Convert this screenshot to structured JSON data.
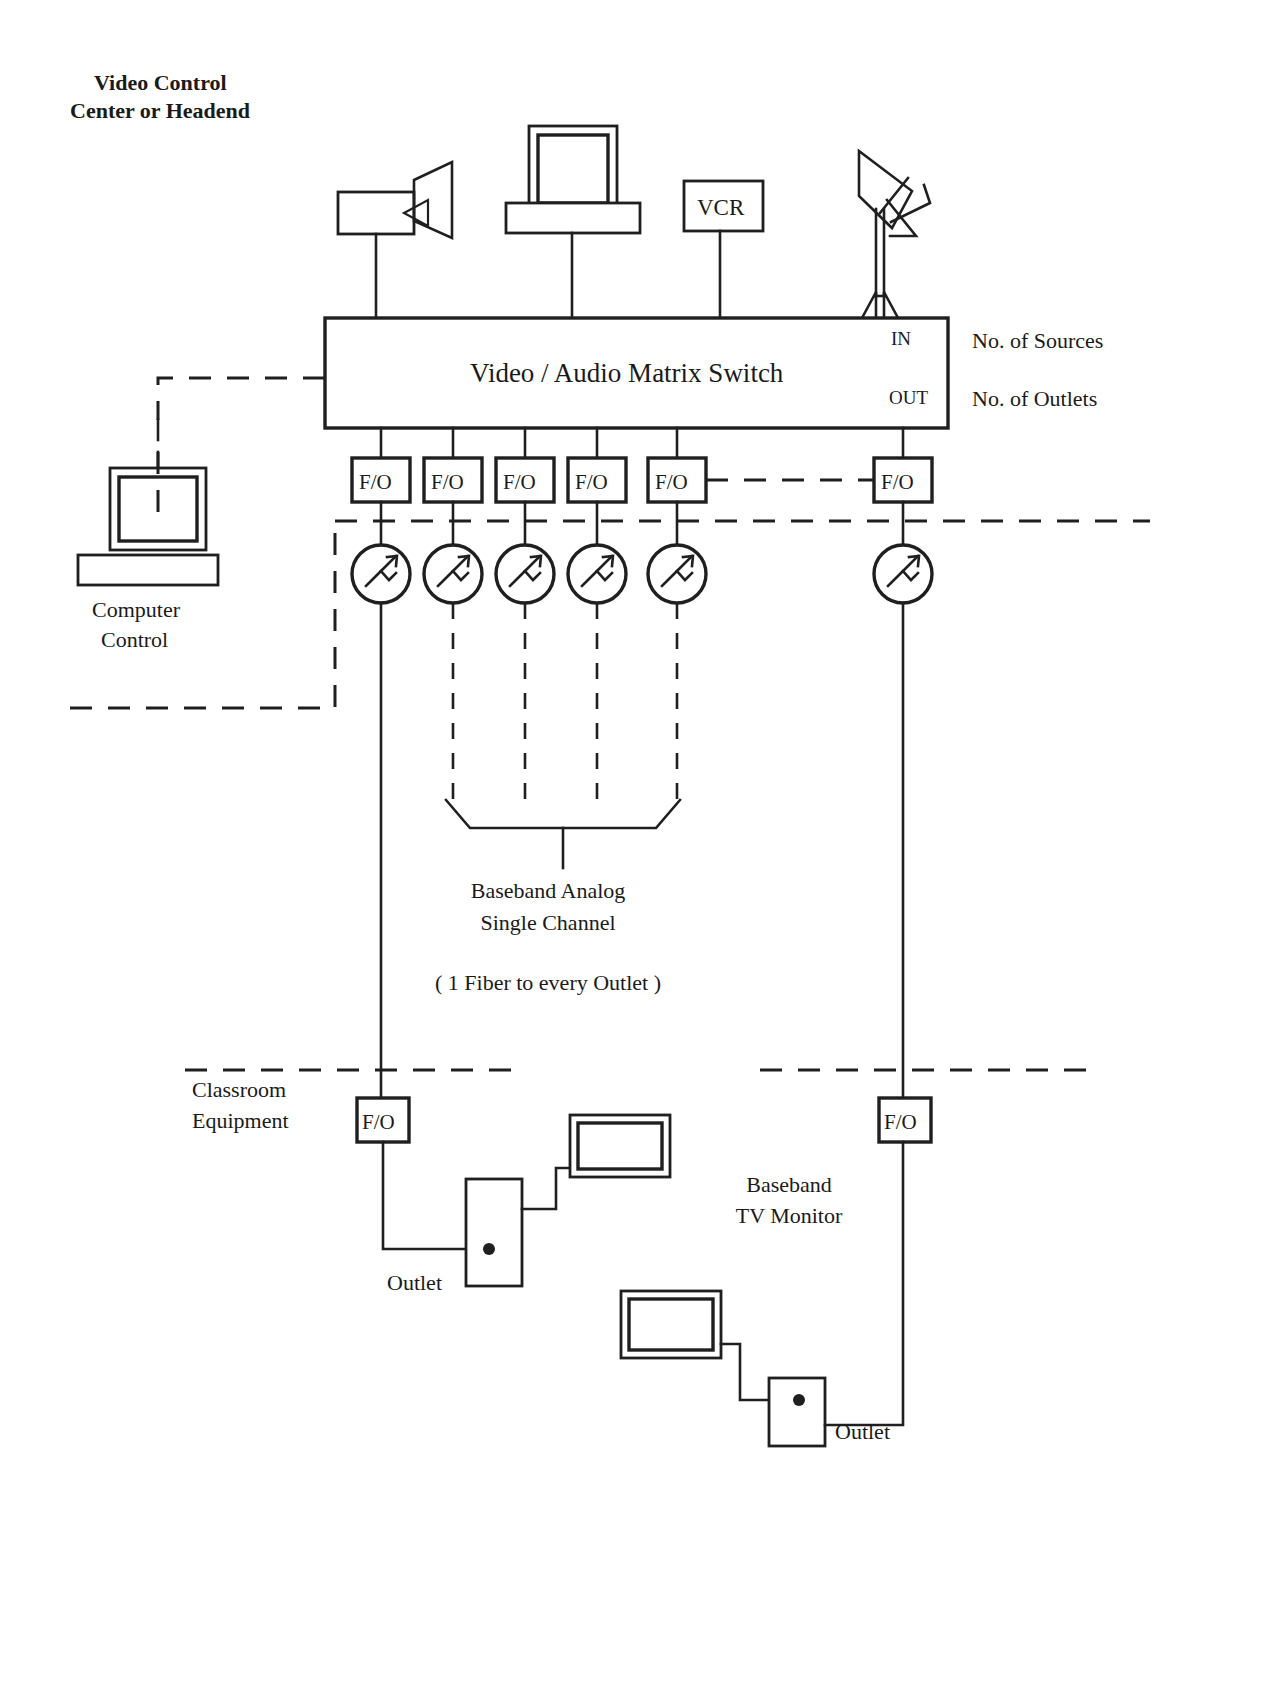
{
  "title": {
    "line1": "Video Control",
    "line2": "Center or Headend"
  },
  "headend": {
    "sources": [
      {
        "name": "camera",
        "label": ""
      },
      {
        "name": "computer-workstation",
        "label": ""
      },
      {
        "name": "vcr",
        "label": "VCR"
      },
      {
        "name": "satellite-dish",
        "label": ""
      }
    ],
    "matrix_switch": {
      "label": "Video / Audio Matrix Switch",
      "in_label": "IN",
      "out_label": "OUT"
    },
    "annotations": {
      "sources": "No. of Sources",
      "outlets": "No. of Outlets"
    },
    "computer_control": {
      "line1": "Computer",
      "line2": "Control"
    }
  },
  "fiber_optic": {
    "label": "F/O",
    "headend_units": [
      "F/O",
      "F/O",
      "F/O",
      "F/O",
      "F/O",
      "F/O"
    ],
    "classroom_units": [
      "F/O",
      "F/O"
    ]
  },
  "transmitters": {
    "count": 6,
    "symbol": "laser-transmitter"
  },
  "bracket_note": {
    "line1": "Baseband Analog",
    "line2": "Single Channel",
    "fiber_note": "( 1 Fiber to every Outlet )"
  },
  "classroom": {
    "label_line1": "Classroom",
    "label_line2": "Equipment",
    "outlet_left": "Outlet",
    "outlet_right": "Outlet",
    "monitor_line1": "Baseband",
    "monitor_line2": "TV Monitor"
  },
  "colors": {
    "ink": "#1f1f1f",
    "paper": "#ffffff"
  }
}
